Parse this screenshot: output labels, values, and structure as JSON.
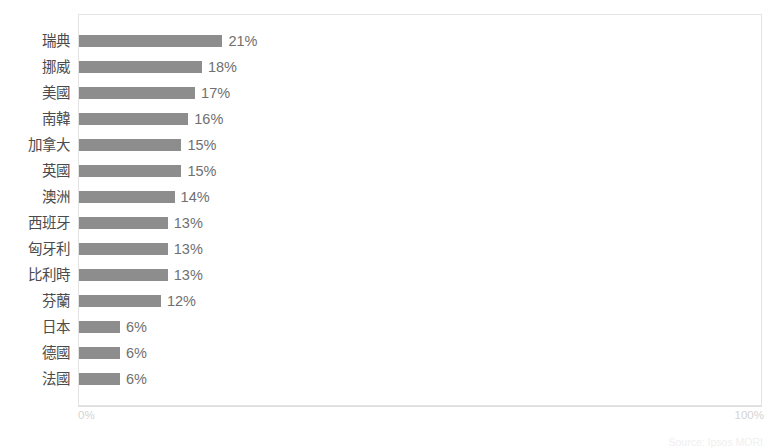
{
  "chart_data": {
    "type": "bar",
    "orientation": "horizontal",
    "title": "",
    "xlabel": "",
    "ylabel": "",
    "xlim": [
      0,
      100
    ],
    "x_tick_labels": [
      "0%",
      "100%"
    ],
    "grid": false,
    "legend": null,
    "value_suffix": "%",
    "bar_color": "#8d8d8d",
    "categories": [
      "瑞典",
      "挪威",
      "美國",
      "南韓",
      "加拿大",
      "英國",
      "澳洲",
      "西班牙",
      "匈牙利",
      "比利時",
      "芬蘭",
      "日本",
      "德國",
      "法國"
    ],
    "values": [
      21,
      18,
      17,
      16,
      15,
      15,
      14,
      13,
      13,
      13,
      12,
      6,
      6,
      6
    ],
    "value_labels": [
      "21%",
      "18%",
      "17%",
      "16%",
      "15%",
      "15%",
      "14%",
      "13%",
      "13%",
      "13%",
      "12%",
      "6%",
      "6%",
      "6%"
    ]
  },
  "axis": {
    "min_label": "0%",
    "max_label": "100%"
  },
  "source": {
    "note": "Source: Ipsos MORI"
  }
}
